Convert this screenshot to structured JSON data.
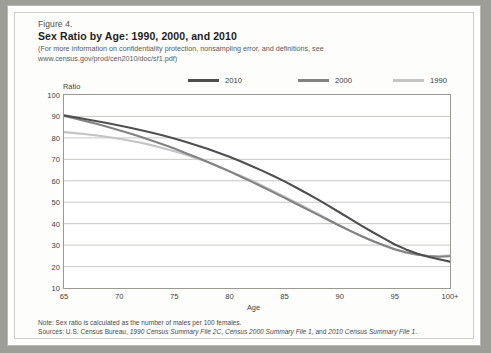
{
  "figure": {
    "number": "Figure 4.",
    "title": "Sex Ratio by Age: 1990, 2000, and 2010",
    "subtitle": "(For more information on confidentiality protection, nonsampling error, and definitions, see www.census.gov/prod/cen2010/doc/sf1.pdf)",
    "note": "Note: Sex ratio is calculated as the number of males per 100 females.",
    "sources_prefix": "Sources: U.S. Census Bureau, ",
    "source_1": "1990 Census Summary File 2C",
    "sources_sep1": ", ",
    "source_2": "Census 2000 Summary File 1",
    "sources_sep2": ", and ",
    "source_3": "2010 Census Summary File 1",
    "sources_end": "."
  },
  "colors": {
    "series_2010": "#4f4f4f",
    "series_2000": "#828282",
    "series_1990": "#c4c4c4",
    "grid": "#b9b9b4",
    "axis": "#8e8e89",
    "text": "#3d3d3d",
    "page": "#ffffff"
  },
  "chart_data": {
    "type": "line",
    "title": "Sex Ratio by Age: 1990, 2000, and 2010",
    "xlabel": "Age",
    "ylabel": "Ratio",
    "xlim": [
      65,
      100
    ],
    "ylim": [
      10,
      100
    ],
    "xticks": [
      "65",
      "70",
      "75",
      "80",
      "85",
      "90",
      "95",
      "100+"
    ],
    "xtick_values": [
      65,
      70,
      75,
      80,
      85,
      90,
      95,
      100
    ],
    "yticks": [
      "10",
      "20",
      "30",
      "40",
      "50",
      "60",
      "70",
      "80",
      "90",
      "100"
    ],
    "ytick_values": [
      10,
      20,
      30,
      40,
      50,
      60,
      70,
      80,
      90,
      100
    ],
    "grid": "horizontal",
    "legend_position": "top",
    "x": [
      65,
      66,
      67,
      68,
      69,
      70,
      71,
      72,
      73,
      74,
      75,
      76,
      77,
      78,
      79,
      80,
      81,
      82,
      83,
      84,
      85,
      86,
      87,
      88,
      89,
      90,
      91,
      92,
      93,
      94,
      95,
      96,
      97,
      98,
      99,
      100
    ],
    "series": [
      {
        "name": "2010",
        "color": "#4f4f4f",
        "values": [
          90.5,
          89.6,
          88.7,
          87.8,
          86.8,
          85.8,
          84.7,
          83.6,
          82.4,
          81.1,
          79.7,
          78.2,
          76.6,
          74.9,
          73.1,
          71.2,
          69.1,
          66.9,
          64.6,
          62.2,
          59.7,
          57.0,
          54.2,
          51.3,
          48.3,
          45.2,
          42.1,
          39.0,
          36.0,
          33.1,
          30.3,
          28.0,
          26.1,
          24.6,
          23.4,
          22.3
        ]
      },
      {
        "name": "2000",
        "color": "#828282",
        "values": [
          90.2,
          89.0,
          87.8,
          86.5,
          85.1,
          83.6,
          82.0,
          80.4,
          78.7,
          76.9,
          75.0,
          73.0,
          71.0,
          68.9,
          66.7,
          64.4,
          62.0,
          59.6,
          57.1,
          54.6,
          52.0,
          49.4,
          46.8,
          44.2,
          41.6,
          39.0,
          36.5,
          34.1,
          31.9,
          29.9,
          28.1,
          26.7,
          25.6,
          24.9,
          24.6,
          24.8
        ]
      },
      {
        "name": "1990",
        "color": "#c4c4c4",
        "values": [
          82.7,
          82.2,
          81.7,
          81.1,
          80.4,
          79.6,
          78.7,
          77.7,
          76.5,
          75.2,
          73.8,
          72.2,
          70.5,
          68.7,
          66.7,
          64.6,
          62.4,
          60.1,
          57.7,
          55.2,
          52.6,
          50.0,
          47.3,
          44.6,
          41.9,
          39.2,
          36.6,
          34.1,
          31.8,
          29.7,
          27.9,
          26.5,
          25.5,
          24.9,
          24.8,
          25.2
        ]
      }
    ]
  },
  "legend": [
    {
      "label": "2010",
      "color": "#4f4f4f"
    },
    {
      "label": "2000",
      "color": "#828282"
    },
    {
      "label": "1990",
      "color": "#c4c4c4"
    }
  ]
}
